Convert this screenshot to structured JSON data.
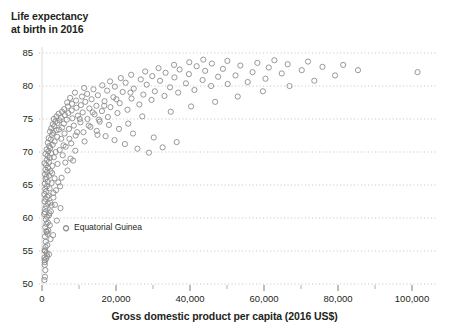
{
  "chart_data": {
    "type": "scatter",
    "title": "Life expectancy\nat birth in 2016",
    "xlabel": "Gross domestic product per capita (2016 US$)",
    "ylabel": "Life expectancy at birth in 2016",
    "xlim": [
      0,
      108000
    ],
    "ylim": [
      47.5,
      86.5
    ],
    "xticks": [
      0,
      20000,
      40000,
      60000,
      80000,
      100000
    ],
    "xtick_labels": [
      "0",
      "20,000",
      "40,000",
      "60,000",
      "80,000",
      "100,000"
    ],
    "x_minor_ticks": [
      10000,
      30000,
      50000,
      70000,
      90000
    ],
    "yticks": [
      50,
      55,
      60,
      65,
      70,
      75,
      80,
      85
    ],
    "ytick_labels": [
      "50",
      "55",
      "60",
      "65",
      "70",
      "75",
      "80",
      "85"
    ],
    "grid": "horizontal-dotted",
    "legend": "none",
    "marker": {
      "shape": "circle-open",
      "radius": 2.6,
      "stroke": "#8c8c8c",
      "stroke_width": 0.9,
      "fill": "none"
    },
    "annotations": [
      {
        "label": "Equatorial Guinea",
        "x": 6500,
        "y": 58.4,
        "marker_x": 66,
        "marker_y": 228
      }
    ],
    "points": [
      [
        740,
        52.9
      ],
      [
        780,
        53.3
      ],
      [
        820,
        51.1
      ],
      [
        690,
        54.0
      ],
      [
        900,
        52.1
      ],
      [
        640,
        50.6
      ],
      [
        1100,
        53.8
      ],
      [
        1250,
        54.7
      ],
      [
        700,
        55.1
      ],
      [
        960,
        55.6
      ],
      [
        1400,
        54.2
      ],
      [
        820,
        57.2
      ],
      [
        1500,
        57.6
      ],
      [
        1700,
        58.1
      ],
      [
        900,
        58.6
      ],
      [
        1200,
        59.1
      ],
      [
        2100,
        58.9
      ],
      [
        1050,
        59.8
      ],
      [
        1350,
        60.2
      ],
      [
        600,
        60.6
      ],
      [
        780,
        60.9
      ],
      [
        1900,
        60.4
      ],
      [
        2400,
        61.0
      ],
      [
        860,
        61.4
      ],
      [
        1150,
        61.8
      ],
      [
        1600,
        62.2
      ],
      [
        700,
        62.5
      ],
      [
        980,
        62.9
      ],
      [
        2200,
        62.3
      ],
      [
        1420,
        63.2
      ],
      [
        650,
        63.6
      ],
      [
        1750,
        63.4
      ],
      [
        1080,
        64.0
      ],
      [
        3100,
        63.8
      ],
      [
        880,
        64.4
      ],
      [
        1320,
        64.8
      ],
      [
        2050,
        64.5
      ],
      [
        760,
        65.2
      ],
      [
        1550,
        65.5
      ],
      [
        1000,
        65.9
      ],
      [
        2600,
        65.3
      ],
      [
        1180,
        66.2
      ],
      [
        820,
        66.6
      ],
      [
        1900,
        66.4
      ],
      [
        3400,
        66.0
      ],
      [
        1400,
        67.0
      ],
      [
        940,
        67.3
      ],
      [
        2300,
        67.1
      ],
      [
        1650,
        67.6
      ],
      [
        1120,
        68.0
      ],
      [
        700,
        68.3
      ],
      [
        2800,
        67.9
      ],
      [
        1850,
        68.5
      ],
      [
        1300,
        68.8
      ],
      [
        4200,
        68.2
      ],
      [
        2100,
        69.1
      ],
      [
        1500,
        69.4
      ],
      [
        950,
        69.7
      ],
      [
        3200,
        69.2
      ],
      [
        2500,
        69.8
      ],
      [
        1700,
        70.1
      ],
      [
        5600,
        69.5
      ],
      [
        1250,
        70.4
      ],
      [
        3700,
        70.0
      ],
      [
        2200,
        70.6
      ],
      [
        1950,
        70.9
      ],
      [
        4800,
        70.3
      ],
      [
        2900,
        71.1
      ],
      [
        1550,
        71.4
      ],
      [
        6400,
        70.8
      ],
      [
        3400,
        71.6
      ],
      [
        2350,
        71.9
      ],
      [
        1800,
        72.1
      ],
      [
        7900,
        71.3
      ],
      [
        4100,
        72.3
      ],
      [
        2700,
        72.6
      ],
      [
        5200,
        72.0
      ],
      [
        3000,
        72.9
      ],
      [
        2150,
        73.1
      ],
      [
        9100,
        72.5
      ],
      [
        3900,
        73.3
      ],
      [
        6100,
        72.8
      ],
      [
        2500,
        73.6
      ],
      [
        4600,
        73.4
      ],
      [
        3300,
        73.9
      ],
      [
        11200,
        73.0
      ],
      [
        5400,
        73.7
      ],
      [
        2900,
        74.2
      ],
      [
        7300,
        73.5
      ],
      [
        4200,
        74.4
      ],
      [
        3600,
        74.6
      ],
      [
        8600,
        74.0
      ],
      [
        5900,
        74.3
      ],
      [
        13100,
        73.8
      ],
      [
        4700,
        74.8
      ],
      [
        3200,
        75.0
      ],
      [
        10400,
        74.5
      ],
      [
        6700,
        74.9
      ],
      [
        5100,
        75.2
      ],
      [
        15600,
        74.6
      ],
      [
        3900,
        75.4
      ],
      [
        8200,
        75.1
      ],
      [
        12300,
        75.0
      ],
      [
        6200,
        75.6
      ],
      [
        4500,
        75.8
      ],
      [
        17800,
        75.3
      ],
      [
        9700,
        75.5
      ],
      [
        7100,
        75.9
      ],
      [
        5400,
        76.1
      ],
      [
        14200,
        75.7
      ],
      [
        11000,
        76.0
      ],
      [
        8000,
        76.3
      ],
      [
        6000,
        76.5
      ],
      [
        20400,
        75.9
      ],
      [
        16200,
        76.2
      ],
      [
        9300,
        76.7
      ],
      [
        7000,
        76.9
      ],
      [
        12800,
        76.6
      ],
      [
        23100,
        76.4
      ],
      [
        10500,
        77.1
      ],
      [
        8100,
        77.3
      ],
      [
        18500,
        76.8
      ],
      [
        14700,
        77.0
      ],
      [
        6800,
        77.5
      ],
      [
        26300,
        77.2
      ],
      [
        11700,
        77.6
      ],
      [
        9200,
        77.8
      ],
      [
        21000,
        77.4
      ],
      [
        16900,
        77.7
      ],
      [
        13400,
        78.0
      ],
      [
        7600,
        78.2
      ],
      [
        29600,
        77.9
      ],
      [
        10800,
        78.4
      ],
      [
        24200,
        78.1
      ],
      [
        19300,
        78.3
      ],
      [
        15100,
        78.6
      ],
      [
        12200,
        78.8
      ],
      [
        33100,
        78.5
      ],
      [
        8900,
        79.0
      ],
      [
        27400,
        78.7
      ],
      [
        21800,
        79.1
      ],
      [
        17600,
        79.3
      ],
      [
        36800,
        79.0
      ],
      [
        13900,
        79.5
      ],
      [
        30500,
        79.2
      ],
      [
        11400,
        79.7
      ],
      [
        24800,
        79.6
      ],
      [
        41200,
        79.4
      ],
      [
        19700,
        79.9
      ],
      [
        16300,
        80.1
      ],
      [
        34600,
        79.8
      ],
      [
        28300,
        80.2
      ],
      [
        45700,
        80.0
      ],
      [
        22600,
        80.5
      ],
      [
        38900,
        80.4
      ],
      [
        18400,
        80.7
      ],
      [
        31900,
        80.8
      ],
      [
        50200,
        80.3
      ],
      [
        26700,
        81.0
      ],
      [
        43400,
        80.9
      ],
      [
        21300,
        81.2
      ],
      [
        35800,
        81.3
      ],
      [
        55600,
        80.6
      ],
      [
        29800,
        81.5
      ],
      [
        47600,
        81.4
      ],
      [
        24100,
        81.7
      ],
      [
        39700,
        81.8
      ],
      [
        60400,
        81.1
      ],
      [
        33400,
        82.0
      ],
      [
        52300,
        81.6
      ],
      [
        27900,
        82.2
      ],
      [
        44100,
        82.3
      ],
      [
        64800,
        81.9
      ],
      [
        37200,
        82.5
      ],
      [
        56900,
        82.1
      ],
      [
        31500,
        82.7
      ],
      [
        48900,
        82.6
      ],
      [
        70200,
        82.4
      ],
      [
        41800,
        83.0
      ],
      [
        61300,
        82.8
      ],
      [
        35700,
        83.2
      ],
      [
        53600,
        83.1
      ],
      [
        75800,
        82.9
      ],
      [
        45900,
        83.4
      ],
      [
        66400,
        83.3
      ],
      [
        39800,
        83.6
      ],
      [
        58200,
        83.5
      ],
      [
        81400,
        83.2
      ],
      [
        50100,
        83.8
      ],
      [
        71900,
        83.7
      ],
      [
        43600,
        84.0
      ],
      [
        62800,
        83.9
      ],
      [
        101500,
        82.1
      ],
      [
        14800,
        73.2
      ],
      [
        17200,
        72.4
      ],
      [
        19600,
        71.8
      ],
      [
        22400,
        71.2
      ],
      [
        25800,
        70.5
      ],
      [
        28900,
        69.9
      ],
      [
        32600,
        70.7
      ],
      [
        36400,
        71.5
      ],
      [
        30200,
        72.2
      ],
      [
        24600,
        72.8
      ],
      [
        20800,
        73.5
      ],
      [
        18100,
        74.1
      ],
      [
        15400,
        74.9
      ],
      [
        23300,
        74.3
      ],
      [
        27100,
        75.4
      ],
      [
        34800,
        76.1
      ],
      [
        40300,
        76.9
      ],
      [
        46800,
        77.6
      ],
      [
        52900,
        78.4
      ],
      [
        59700,
        79.2
      ],
      [
        66900,
        80.0
      ],
      [
        73600,
        80.8
      ],
      [
        79200,
        81.6
      ],
      [
        85400,
        82.4
      ],
      [
        8400,
        68.7
      ],
      [
        6900,
        67.2
      ],
      [
        5300,
        66.1
      ],
      [
        4400,
        65.4
      ],
      [
        3800,
        64.2
      ],
      [
        3100,
        63.1
      ],
      [
        2600,
        61.9
      ],
      [
        2000,
        60.7
      ],
      [
        1600,
        59.3
      ],
      [
        1300,
        57.9
      ],
      [
        1000,
        56.4
      ],
      [
        850,
        55.0
      ],
      [
        720,
        53.6
      ],
      [
        5800,
        71.0
      ],
      [
        7400,
        72.0
      ],
      [
        9500,
        73.0
      ],
      [
        12600,
        74.0
      ],
      [
        10200,
        75.0
      ],
      [
        13700,
        76.0
      ],
      [
        16800,
        77.0
      ],
      [
        20100,
        78.0
      ],
      [
        23900,
        79.0
      ],
      [
        3500,
        62.0
      ],
      [
        4900,
        64.8
      ],
      [
        2750,
        66.8
      ],
      [
        6300,
        68.4
      ],
      [
        11500,
        71.6
      ],
      [
        9000,
        70.2
      ],
      [
        7700,
        69.0
      ],
      [
        15000,
        72.6
      ],
      [
        2300,
        56.8
      ],
      [
        1150,
        58.0
      ],
      [
        1450,
        55.9
      ],
      [
        1900,
        54.5
      ],
      [
        3000,
        57.4
      ],
      [
        4000,
        59.6
      ],
      [
        5000,
        61.5
      ],
      [
        6500,
        58.4
      ]
    ]
  }
}
